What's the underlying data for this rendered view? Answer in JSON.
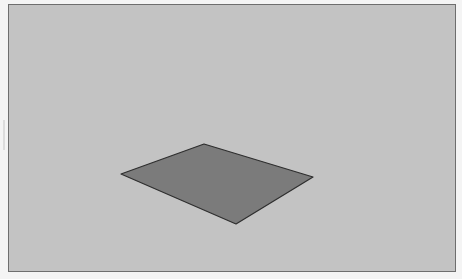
{
  "viewport": {
    "name": "3d-modeling-viewport",
    "background_color": "#c3c3c3",
    "border_color": "#6e6e6e",
    "page_background": "#f4f4f4",
    "bounds": {
      "left": 8,
      "top": 4,
      "right": 456,
      "bottom": 272
    }
  },
  "scene": {
    "faces": [
      {
        "name": "rectangle-face",
        "fill": "#7b7b7b",
        "stroke": "#2e2e2e",
        "points": "121,174 204,144 313,177 236,224"
      }
    ]
  }
}
